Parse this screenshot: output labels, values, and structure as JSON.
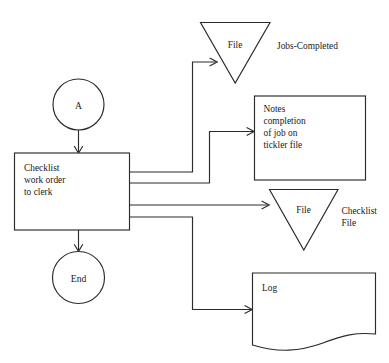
{
  "diagram": {
    "background_color": "#ffffff",
    "stroke_color": "#2b2b2b",
    "nodes": {
      "connector_a": {
        "shape": "circle",
        "label": "A"
      },
      "process_checklist": {
        "shape": "rectangle",
        "label_lines": [
          "Checklist",
          "work order",
          "to clerk"
        ],
        "line1": "Checklist",
        "line2": "work order",
        "line3": "to clerk"
      },
      "terminator_end": {
        "shape": "circle",
        "label": "End"
      },
      "file_jobs_completed": {
        "shape": "inverted-triangle",
        "inner_label": "File",
        "side_label": "Jobs-Completed"
      },
      "notes_tickler": {
        "shape": "rectangle",
        "label_lines": [
          "Notes",
          "completion",
          "of job on",
          "tickler file"
        ],
        "line1": "Notes",
        "line2": "completion",
        "line3": "of job on",
        "line4": "tickler file"
      },
      "file_checklist": {
        "shape": "inverted-triangle",
        "inner_label": "File",
        "side_label_line1": "Checklist",
        "side_label_line2": "File"
      },
      "document_log": {
        "shape": "document",
        "label": "Log"
      }
    },
    "connectors": [
      {
        "name": "a-to-process",
        "from": "connector_a",
        "to": "process_checklist",
        "arrow": true
      },
      {
        "name": "process-to-end",
        "from": "process_checklist",
        "to": "terminator_end",
        "arrow": true
      },
      {
        "name": "process-to-jobs-completed-file",
        "from": "process_checklist",
        "to": "file_jobs_completed",
        "arrow": true
      },
      {
        "name": "process-to-notes",
        "from": "process_checklist",
        "to": "notes_tickler",
        "arrow": true
      },
      {
        "name": "process-to-checklist-file",
        "from": "process_checklist",
        "to": "file_checklist",
        "arrow": true
      },
      {
        "name": "process-to-log",
        "from": "process_checklist",
        "to": "document_log",
        "arrow": true
      }
    ]
  }
}
